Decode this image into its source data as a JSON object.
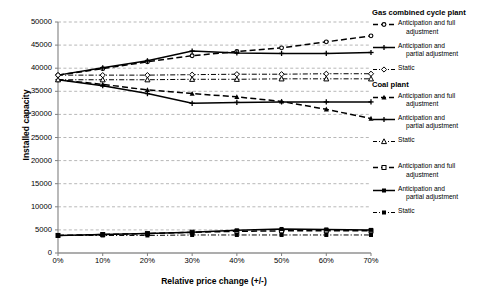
{
  "chart_data": {
    "type": "line",
    "title": "",
    "xlabel": "Relative price change (+/-)",
    "ylabel": "Installed capacity",
    "x": [
      0,
      10,
      20,
      30,
      40,
      50,
      60,
      70
    ],
    "xticklabels": [
      "0%",
      "10%",
      "20%",
      "30%",
      "40%",
      "50%",
      "60%",
      "70%"
    ],
    "yticklabels": [
      "0",
      "5000",
      "10000",
      "15000",
      "20000",
      "25000",
      "30000",
      "35000",
      "40000",
      "45000",
      "50000"
    ],
    "ylim": [
      0,
      50000
    ],
    "xlim": [
      0,
      70
    ],
    "ytick_step": 5000,
    "grid": "horizontal-dashed",
    "legend_position": "right",
    "series": [
      {
        "name": "Gas combined cycle plant - Anticipation and full adjustment",
        "group": "Gas combined cycle plant",
        "style": "dashed",
        "marker": "open-circle",
        "values": [
          38500,
          39900,
          41400,
          42700,
          43600,
          44400,
          45700,
          47000
        ]
      },
      {
        "name": "Gas combined cycle plant - Anticipation and partial adjustment",
        "group": "Gas combined cycle plant",
        "style": "solid",
        "marker": "plus",
        "values": [
          38500,
          40100,
          41600,
          43700,
          43300,
          43200,
          43200,
          43400
        ]
      },
      {
        "name": "Gas combined cycle plant - Static",
        "group": "Gas combined cycle plant",
        "style": "dash-dot",
        "marker": "open-diamond",
        "values": [
          38500,
          38500,
          38500,
          38600,
          38700,
          38700,
          38800,
          38800
        ]
      },
      {
        "name": "Coal plant - Anticipation and full adjustment",
        "group": "Coal plant",
        "style": "dashed",
        "marker": "filled-triangle",
        "values": [
          37500,
          36500,
          35300,
          34500,
          33800,
          32800,
          31100,
          29100
        ]
      },
      {
        "name": "Coal plant - Anticipation and partial adjustment",
        "group": "Coal plant",
        "style": "solid",
        "marker": "plus",
        "values": [
          37500,
          36200,
          34500,
          32400,
          32600,
          32700,
          32700,
          32700
        ]
      },
      {
        "name": "Coal plant - Static",
        "group": "Coal plant",
        "style": "dash-dot",
        "marker": "open-triangle",
        "values": [
          37500,
          37500,
          37500,
          37600,
          37600,
          37700,
          37700,
          37700
        ]
      },
      {
        "name": "Anticipation and full adjustment",
        "group": "",
        "style": "dashed",
        "marker": "open-square",
        "values": [
          3800,
          4000,
          4200,
          4500,
          4700,
          4800,
          4800,
          4800
        ]
      },
      {
        "name": "Anticipation and partial adjustment",
        "group": "",
        "style": "solid",
        "marker": "filled-square",
        "values": [
          3800,
          4000,
          4200,
          4500,
          4900,
          5200,
          5100,
          5000
        ]
      },
      {
        "name": "Static",
        "group": "",
        "style": "dash-dot",
        "marker": "filled-square",
        "values": [
          3800,
          3800,
          3800,
          3900,
          3900,
          3900,
          3900,
          3900
        ]
      }
    ]
  },
  "axes": {
    "ylabel": "Installed capacity",
    "xlabel": "Relative price change (+/-)"
  },
  "legend": {
    "groups": [
      {
        "header": "Gas combined cycle plant",
        "items": [
          {
            "line1": "Anticipation and full",
            "line2": "adjustment"
          },
          {
            "line1": "Anticipation and",
            "line2": "partial adjustment"
          },
          {
            "line1": "Static",
            "line2": ""
          }
        ]
      },
      {
        "header": "Coal plant",
        "items": [
          {
            "line1": "Anticipation and full",
            "line2": "adjustment"
          },
          {
            "line1": "Anticipation and",
            "line2": "partial adjustment"
          },
          {
            "line1": "Static",
            "line2": ""
          }
        ]
      },
      {
        "header": "",
        "items": [
          {
            "line1": "Anticipation and full",
            "line2": "adjustment"
          },
          {
            "line1": "Anticipation and",
            "line2": "partial adjustment"
          },
          {
            "line1": "Static",
            "line2": ""
          }
        ]
      }
    ]
  },
  "colors": {
    "line": "#000000",
    "grid": "#9a9a9a",
    "axis": "#808080",
    "background": "#ffffff"
  }
}
